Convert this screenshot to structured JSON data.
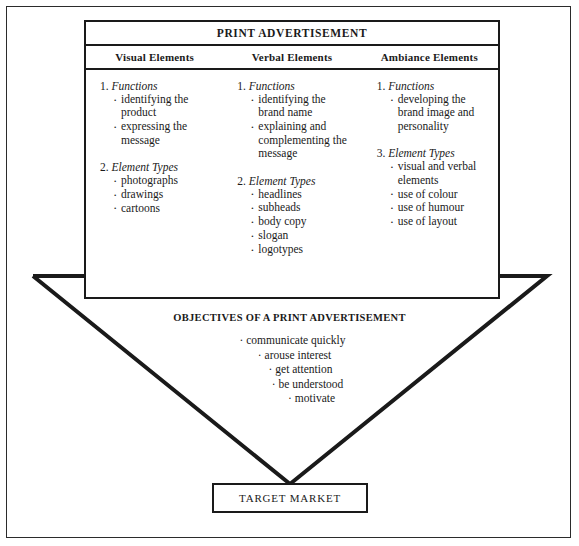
{
  "main_box": {
    "title": "PRINT ADVERTISEMENT",
    "column_headers": [
      "Visual Elements",
      "Verbal Elements",
      "Ambiance Elements"
    ],
    "columns": [
      {
        "name": "visual-elements",
        "groups": [
          {
            "number": "1.",
            "label": "Functions",
            "items": [
              "identifying the product",
              "expressing the message"
            ]
          },
          {
            "number": "2.",
            "label": "Element Types",
            "items": [
              "photographs",
              "drawings",
              "cartoons"
            ]
          }
        ]
      },
      {
        "name": "verbal-elements",
        "groups": [
          {
            "number": "1.",
            "label": "Functions",
            "items": [
              "identifying the brand name",
              "explaining and complementing the message"
            ]
          },
          {
            "number": "2.",
            "label": "Element Types",
            "items": [
              "headlines",
              "subheads",
              "body copy",
              "slogan",
              "logotypes"
            ]
          }
        ]
      },
      {
        "name": "ambiance-elements",
        "groups": [
          {
            "number": "1.",
            "label": "Functions",
            "items": [
              "developing the brand image and personality"
            ]
          },
          {
            "number": "3.",
            "label": "Element Types",
            "items": [
              "visual and verbal elements",
              "use of colour",
              "use of humour",
              "use of layout"
            ]
          }
        ]
      }
    ]
  },
  "objectives": {
    "title": "OBJECTIVES OF A PRINT ADVERTISEMENT",
    "items": [
      "communicate quickly",
      "arouse interest",
      "get attention",
      "be understood",
      "motivate"
    ],
    "bullet": "·"
  },
  "target": {
    "label": "TARGET MARKET"
  },
  "colors": {
    "ink": "#1a1a1a",
    "background": "#ffffff"
  }
}
